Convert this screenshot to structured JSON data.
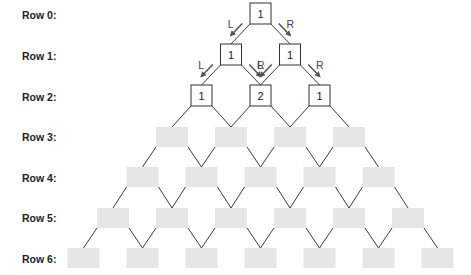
{
  "colors": {
    "edge": "#3a3a3a",
    "node_border": "#333333",
    "node_fill": "#ffffff",
    "blank_fill": "#e6e6e6",
    "arrow": "#555555",
    "text": "#222222"
  },
  "rows": [
    {
      "label": "Row 0:",
      "values": [
        "1"
      ]
    },
    {
      "label": "Row 1:",
      "values": [
        "1",
        "1"
      ]
    },
    {
      "label": "Row 2:",
      "values": [
        "1",
        "2",
        "1"
      ]
    },
    {
      "label": "Row 3:",
      "values": [
        "",
        "",
        "",
        ""
      ]
    },
    {
      "label": "Row 4:",
      "values": [
        "",
        "",
        "",
        "",
        ""
      ]
    },
    {
      "label": "Row 5:",
      "values": [
        "",
        "",
        "",
        "",
        "",
        ""
      ]
    },
    {
      "label": "Row 6:",
      "values": [
        "",
        "",
        "",
        "",
        "",
        "",
        ""
      ]
    }
  ],
  "arrows": [
    {
      "label": "L",
      "from_row": 0,
      "from_index": 0,
      "direction": "left"
    },
    {
      "label": "R",
      "from_row": 0,
      "from_index": 0,
      "direction": "right"
    },
    {
      "label": "L",
      "from_row": 1,
      "from_index": 0,
      "direction": "left"
    },
    {
      "label": "R",
      "from_row": 1,
      "from_index": 0,
      "direction": "right"
    },
    {
      "label": "L",
      "from_row": 1,
      "from_index": 1,
      "direction": "left"
    },
    {
      "label": "R",
      "from_row": 1,
      "from_index": 1,
      "direction": "right"
    }
  ]
}
